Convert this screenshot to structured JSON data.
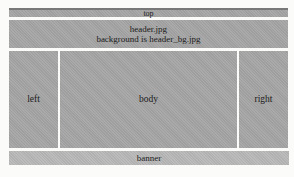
{
  "diagram": {
    "background_color": "#fbfbf9",
    "block_color": "#a5a5a5",
    "banner_color": "#b8b8b8",
    "text_color": "#1c1c1c",
    "regions": {
      "top": {
        "label": "top",
        "color": "#a5a5a5"
      },
      "header": {
        "line1": "header.jpg",
        "line2": "background is header_bg.jpg",
        "color": "#a5a5a5"
      },
      "left": {
        "label": "left",
        "color": "#a5a5a5"
      },
      "body": {
        "label": "body",
        "color": "#a5a5a5"
      },
      "right": {
        "label": "right",
        "color": "#a5a5a5"
      },
      "banner": {
        "label": "banner",
        "color": "#b8b8b8"
      }
    }
  }
}
